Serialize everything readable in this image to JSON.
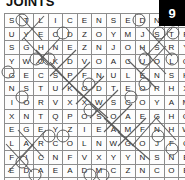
{
  "puzzle": {
    "title": "JOINTS",
    "badge_number": "9",
    "rows": 13,
    "cols": 13,
    "grid": [
      [
        "S",
        "T",
        "L",
        "I",
        "C",
        "E",
        "N",
        "S",
        "E",
        "D",
        "N",
        "D",
        "M"
      ],
      [
        "U",
        "Y",
        "E",
        "C",
        "D",
        "Z",
        "O",
        "Y",
        "M",
        "J",
        "S",
        "T",
        "P"
      ],
      [
        "S",
        "G",
        "H",
        "N",
        "E",
        "Z",
        "N",
        "J",
        "O",
        "H",
        "S",
        "R",
        "Y"
      ],
      [
        "Y",
        "W",
        "O",
        "K",
        "D",
        "V",
        "O",
        "A",
        "C",
        "U",
        "O",
        "L",
        "G"
      ],
      [
        "G",
        "E",
        "C",
        "S",
        "P",
        "F",
        "N",
        "U",
        "L",
        "E",
        "N",
        "S",
        "H"
      ],
      [
        "N",
        "S",
        "T",
        "U",
        "K",
        "O",
        "D",
        "T",
        "E",
        "O",
        "R",
        "H",
        "X"
      ],
      [
        "I",
        "O",
        "R",
        "V",
        "X",
        "X",
        "W",
        "S",
        "C",
        "O",
        "Y",
        "A",
        "M"
      ],
      [
        "X",
        "N",
        "T",
        "Q",
        "P",
        "O",
        "S",
        "O",
        "A",
        "E",
        "G",
        "H",
        "O"
      ],
      [
        "E",
        "G",
        "E",
        "Y",
        "Z",
        "I",
        "E",
        "A",
        "M",
        "F",
        "N",
        "H",
        "W"
      ],
      [
        "L",
        "A",
        "R",
        "C",
        "O",
        "L",
        "N",
        "W",
        "G",
        "O",
        "J",
        "F",
        "C"
      ],
      [
        "F",
        "I",
        "C",
        "N",
        "F",
        "V",
        "X",
        "Y",
        "Y",
        "N",
        "S",
        "N",
        "E"
      ],
      [
        "E",
        "D",
        "A",
        "E",
        "A",
        "D",
        "M",
        "C",
        "Z",
        "N",
        "C",
        "O",
        "E"
      ],
      [
        "B",
        "L",
        "R",
        "M",
        "G",
        "D",
        "L",
        "A",
        "C",
        "I",
        "D",
        "E",
        "M"
      ]
    ],
    "colors": {
      "grid_line": "#8d8d8d",
      "badge_background": "#000000",
      "badge_text": "#ffffff",
      "letter": "#1a1a1a",
      "mark": "#5c5c5c",
      "page_background": "#ffffff"
    }
  }
}
